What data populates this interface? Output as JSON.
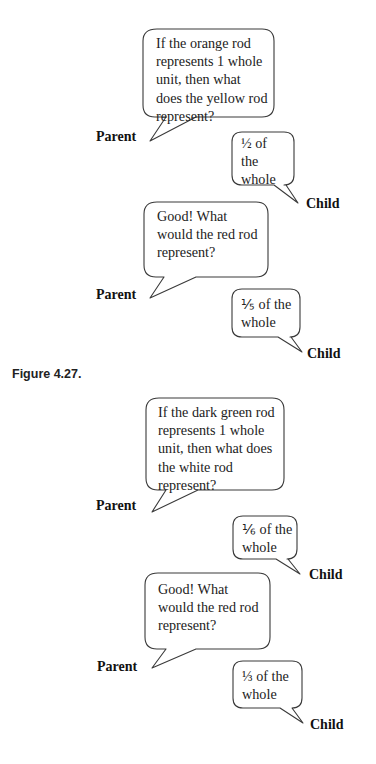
{
  "figure_caption": "Figure 4.27.",
  "dialogues": [
    {
      "parent_label": "Parent",
      "parent_lines": [
        "If the orange rod",
        "represents 1 whole",
        "unit, then what",
        "does the yellow rod",
        "represent?"
      ],
      "child_label": "Child",
      "child_lines": [
        "½ of",
        "the",
        "whole"
      ]
    },
    {
      "parent_label": "Parent",
      "parent_lines": [
        "Good! What",
        "would the red rod",
        "represent?"
      ],
      "child_label": "Child",
      "child_lines": [
        "⅕ of the",
        "whole"
      ]
    },
    {
      "parent_label": "Parent",
      "parent_lines": [
        "If the dark green rod",
        "represents 1 whole",
        "unit, then what does",
        "the white rod",
        "represent?"
      ],
      "child_label": "Child",
      "child_lines": [
        "⅙ of the",
        "whole"
      ]
    },
    {
      "parent_label": "Parent",
      "parent_lines": [
        "Good! What",
        "would the red rod",
        "represent?"
      ],
      "child_label": "Child",
      "child_lines": [
        "⅓ of the",
        "whole"
      ]
    }
  ]
}
